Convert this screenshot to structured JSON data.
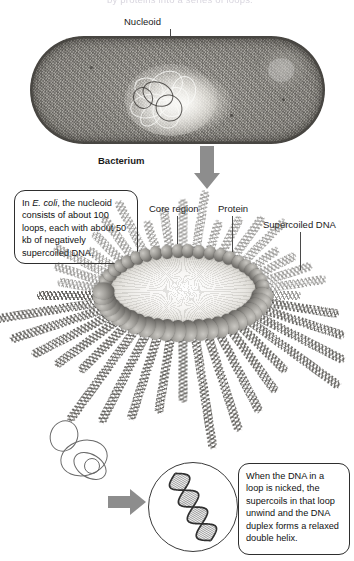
{
  "figure": {
    "top_caption": "by proteins into a series of loops.",
    "labels": {
      "nucleoid": "Nucleoid",
      "bacterium": "Bacterium",
      "core_region": "Core region",
      "protein": "Protein",
      "supercoiled_dna": "Supercoiled DNA"
    },
    "callouts": {
      "left": {
        "line1_pre": "In ",
        "line1_italic": "E. coli",
        "line1_post": ", the nucleoid consists of about 100 loops, each with about 50 kb of negatively supercoiled DNA."
      },
      "bottom": {
        "text": "When the DNA in a loop is nicked, the supercoils in that loop unwind and the DNA duplex forms a relaxed double helix."
      }
    },
    "colors": {
      "arrow_gray": "#8d8d8d",
      "bead_gray": "#6f6d69",
      "dna_gray": "#595753",
      "outline": "#2e2e2e",
      "core_light": "#f7f6f4",
      "background": "#ffffff"
    },
    "icons": {
      "arrow_bacterium": "down-arrow-icon",
      "arrow_rosette": "down-arrow-icon",
      "arrow_magnifier": "right-arrow-icon"
    }
  }
}
